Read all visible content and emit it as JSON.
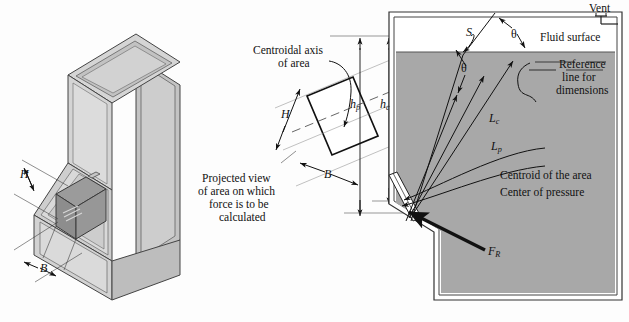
{
  "figure": {
    "background_color": "#fdfdfd",
    "fluid_color": "#a8a8a8",
    "wall_color": "#d8d8d8",
    "line_color": "#111111"
  },
  "left_panel": {
    "name": "isometric-tank-view",
    "labels": {
      "height_symbol": "H",
      "width_symbol": "B"
    },
    "colors": {
      "face_light": "#d9d9d9",
      "face_mid": "#c9c9c9",
      "face_dark": "#b5b5b5",
      "gate_panel": "#8f8f8f",
      "gate_frame": "#bdbdbd"
    }
  },
  "middle_panel": {
    "name": "projected-area-view",
    "centroidal_axis_label_line1": "Centroidal axis",
    "centroidal_axis_label_line2": "of area",
    "projected_view_line1": "Projected view",
    "projected_view_line2": "of area on which",
    "projected_view_line3": "force is to be",
    "projected_view_line4": "calculated",
    "height_symbol": "H",
    "width_symbol": "B",
    "depth_pressure_symbol": "h",
    "depth_pressure_subscript": "p",
    "depth_centroid_symbol": "h",
    "depth_centroid_subscript": "c"
  },
  "right_panel": {
    "name": "tank-cross-section-view",
    "vent_label": "Vent",
    "fluid_surface_label": "Fluid surface",
    "surface_distance_symbol": "S",
    "angle_symbol_1": "θ",
    "angle_symbol_2": "θ",
    "reference_line1": "Reference",
    "reference_line2": "line for",
    "reference_line3": "dimensions",
    "slant_centroid_symbol": "L",
    "slant_centroid_subscript": "c",
    "slant_pressure_symbol": "L",
    "slant_pressure_subscript": "p",
    "centroid_label": "Centroid of the area",
    "center_of_pressure_label": "Center of pressure",
    "resultant_force_symbol": "F",
    "resultant_force_subscript": "R"
  }
}
